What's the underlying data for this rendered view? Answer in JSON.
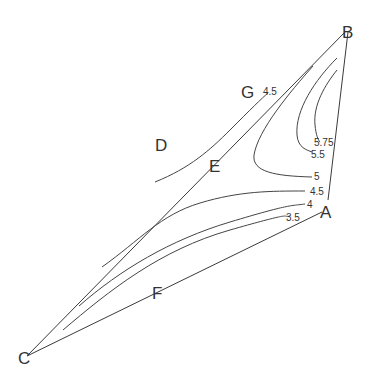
{
  "diagram": {
    "title": "",
    "vertices": {
      "A": {
        "label": "A"
      },
      "B": {
        "label": "B"
      },
      "C": {
        "label": "C"
      },
      "D": {
        "label": "D"
      },
      "E": {
        "label": "E"
      },
      "F": {
        "label": "F"
      },
      "G": {
        "label": "G"
      }
    },
    "edges": [
      "B-A",
      "A-C",
      "C-B"
    ],
    "contours": [
      {
        "value": "3.5",
        "label": "3.5"
      },
      {
        "value": "4",
        "label": "4"
      },
      {
        "value": "4.5",
        "label": "4.5"
      },
      {
        "value": "4.5",
        "label": "4.5"
      },
      {
        "value": "5",
        "label": "5"
      },
      {
        "value": "5.5",
        "label": "5.5"
      },
      {
        "value": "5.75",
        "label": "5.75"
      }
    ],
    "colors": {
      "line": "#3a3a3a",
      "text": "#333333",
      "background": "#ffffff"
    }
  }
}
